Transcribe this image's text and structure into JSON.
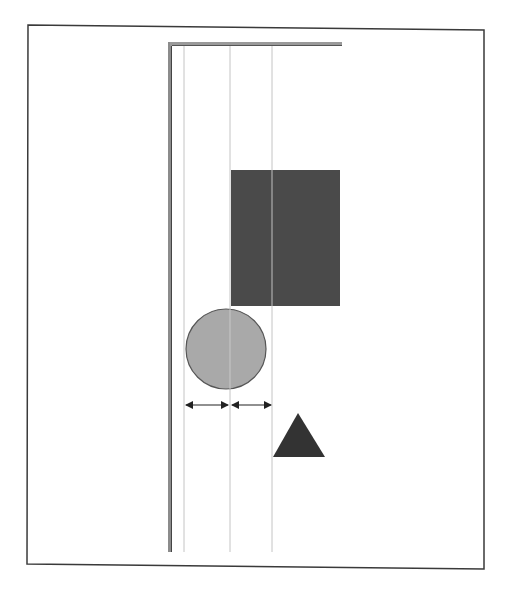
{
  "figure": {
    "type": "alignment-layout-diagram",
    "frame": {
      "x1": 28,
      "y1": 25,
      "x2": 484,
      "y2": 566,
      "stroke": "#3a3a3a"
    },
    "container_edge": {
      "vertical": {
        "x": 170,
        "y1": 42,
        "y2": 552,
        "width": 4,
        "color": "#8c8c8c"
      },
      "horizontal": {
        "x1": 170,
        "x2": 342,
        "y": 44,
        "width": 4,
        "color": "#9a9a9a"
      }
    },
    "guide_lines": [
      {
        "name": "guide-line-left",
        "x": 184,
        "y1": 46,
        "y2": 552
      },
      {
        "name": "guide-line-center",
        "x": 230,
        "y1": 46,
        "y2": 552
      },
      {
        "name": "guide-line-right",
        "x": 272,
        "y1": 46,
        "y2": 552
      }
    ],
    "guide_color": "#c4c4c4",
    "shapes": {
      "rectangle": {
        "x": 231,
        "y": 170,
        "w": 109,
        "h": 136,
        "fill": "#4a4a4a"
      },
      "circle": {
        "cx": 226,
        "cy": 349,
        "r": 40,
        "fill": "#a9a9a9",
        "stroke": "#555555"
      },
      "triangle": {
        "points": "298,413 273,457 325,457",
        "fill": "#333333"
      }
    },
    "spacing_arrows": [
      {
        "name": "spacing-arrow-left",
        "x1": 186,
        "x2": 228,
        "y": 405
      },
      {
        "name": "spacing-arrow-right",
        "x1": 232,
        "x2": 271,
        "y": 405
      }
    ],
    "arrow_color": "#222222"
  }
}
